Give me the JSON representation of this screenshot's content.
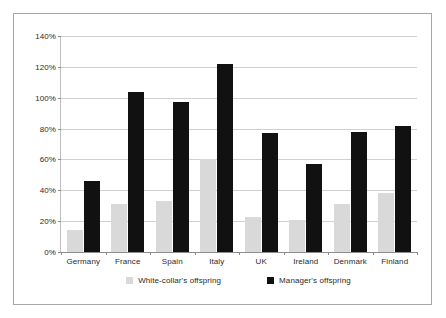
{
  "chart_data": {
    "type": "bar",
    "title": "",
    "xlabel": "",
    "ylabel": "",
    "ylim": [
      0,
      140
    ],
    "grid": true,
    "legend_position": "bottom",
    "categories": [
      "Germany",
      "France",
      "Spain",
      "Italy",
      "UK",
      "Ireland",
      "Denmark",
      "Finland"
    ],
    "y_ticks": [
      "0%",
      "20%",
      "40%",
      "60%",
      "80%",
      "100%",
      "120%",
      "140%"
    ],
    "y_tick_values": [
      0,
      20,
      40,
      60,
      80,
      100,
      120,
      140
    ],
    "series": [
      {
        "name": "White-collar's offspring",
        "color": "#d9d9d9",
        "values": [
          14,
          31,
          33,
          60,
          23,
          21,
          31,
          38
        ]
      },
      {
        "name": "Manager's offspring",
        "color": "#111111",
        "values": [
          46,
          104,
          97,
          122,
          77,
          57,
          78,
          82
        ]
      }
    ]
  },
  "legend": {
    "items": [
      {
        "label": "White-collar's offspring",
        "color": "#d9d9d9"
      },
      {
        "label": "Manager's offspring",
        "color": "#111111"
      }
    ]
  }
}
